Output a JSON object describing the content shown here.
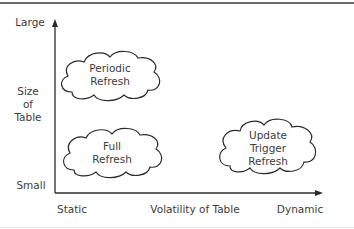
{
  "diagram": {
    "type": "quadrant-diagram",
    "y_axis": {
      "title_lines": [
        "Size",
        "of",
        "Table"
      ],
      "top_label": "Large",
      "bottom_label": "Small"
    },
    "x_axis": {
      "title": "Volatility of Table",
      "left_label": "Static",
      "right_label": "Dynamic"
    },
    "clouds": [
      {
        "id": "periodic",
        "lines": [
          "Periodic",
          "Refresh"
        ]
      },
      {
        "id": "full",
        "lines": [
          "Full",
          "Refresh"
        ]
      },
      {
        "id": "update-trigger",
        "lines": [
          "Update",
          "Trigger",
          "Refresh"
        ]
      }
    ],
    "colors": {
      "stroke": "#2b2b2b",
      "text": "#3d3d3d",
      "border": "#6a6a6a"
    }
  }
}
